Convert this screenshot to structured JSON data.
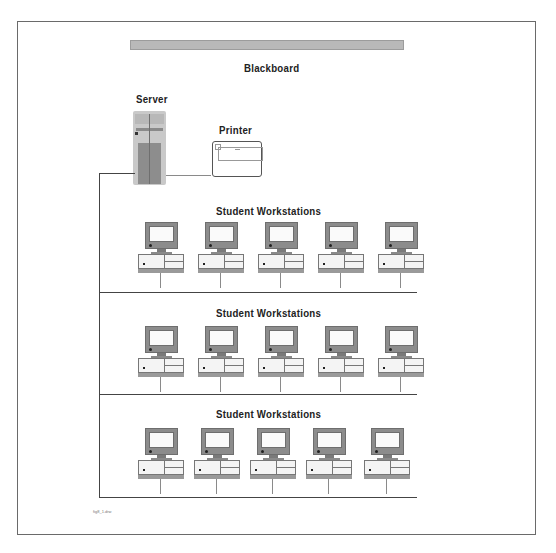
{
  "diagram": {
    "title_bar_label": "Blackboard",
    "server_label": "Server",
    "printer_label": "Printer",
    "rows": [
      {
        "label": "Student Workstations",
        "workstations": 5
      },
      {
        "label": "Student Workstations",
        "workstations": 5
      },
      {
        "label": "Student Workstations",
        "workstations": 5
      }
    ],
    "file_label": "fig8_1.drw",
    "colors": {
      "frame": "#6a6a6a",
      "blackboard": "#b9b9b9",
      "equipment_gray": "#8c8c8c",
      "line": "#444444"
    }
  }
}
